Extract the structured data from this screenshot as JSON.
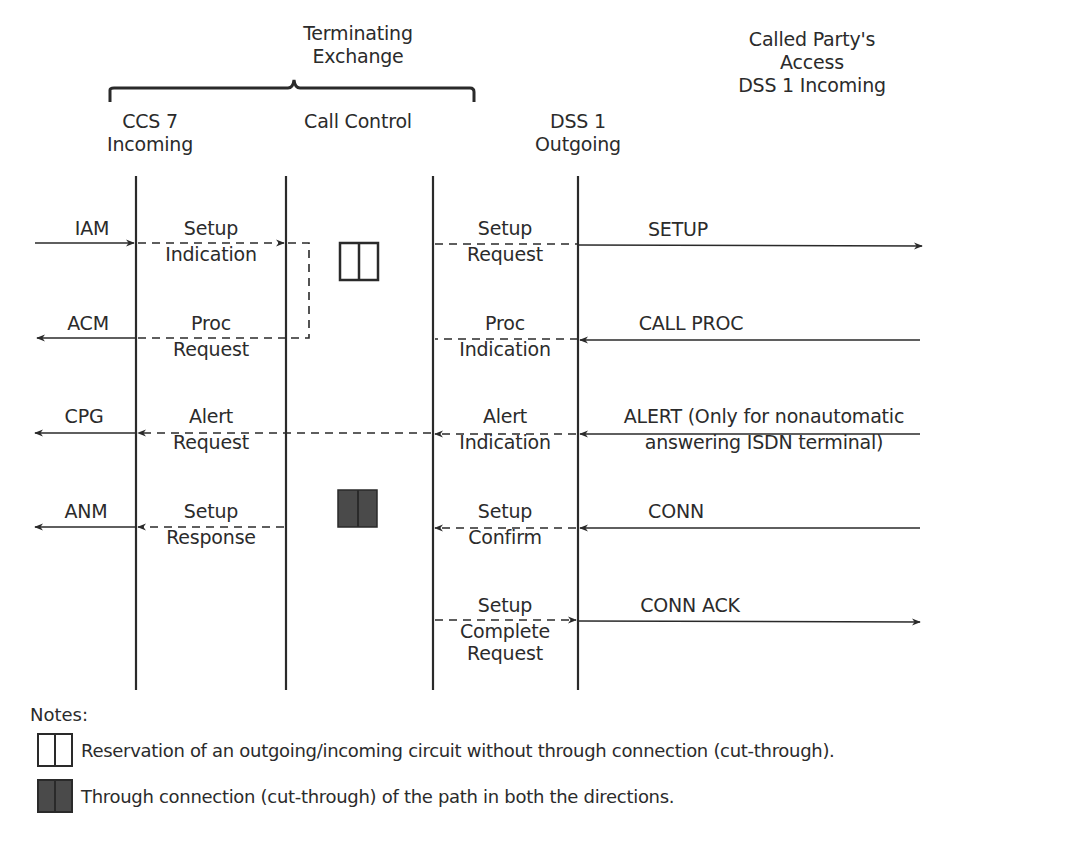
{
  "header": {
    "exchange_title": [
      "Terminating",
      "Exchange"
    ],
    "called_party": [
      "Called Party's",
      "Access",
      "DSS 1 Incoming"
    ],
    "columns": [
      {
        "id": "ccs7",
        "lines": [
          "CCS 7",
          "Incoming"
        ]
      },
      {
        "id": "call_control",
        "lines": [
          "Call Control"
        ]
      },
      {
        "id": "dss1_out",
        "lines": [
          "DSS 1",
          "Outgoing"
        ]
      }
    ]
  },
  "messages": {
    "left": [
      {
        "label": "IAM",
        "direction": "right"
      },
      {
        "label": "ACM",
        "direction": "left"
      },
      {
        "label": "CPG",
        "direction": "left"
      },
      {
        "label": "ANM",
        "direction": "left"
      }
    ],
    "ccs7_to_cc": [
      {
        "lines": [
          "Setup",
          "Indication"
        ],
        "direction": "right"
      },
      {
        "lines": [
          "Proc",
          "Request"
        ],
        "direction": "left"
      },
      {
        "lines": [
          "Alert",
          "Request"
        ],
        "direction": "left"
      },
      {
        "lines": [
          "Setup",
          "Response"
        ],
        "direction": "left"
      }
    ],
    "cc_to_dss1": [
      {
        "lines": [
          "Setup",
          "Request"
        ],
        "direction": "right"
      },
      {
        "lines": [
          "Proc",
          "Indication"
        ],
        "direction": "left"
      },
      {
        "lines": [
          "Alert",
          "Indication"
        ],
        "direction": "left"
      },
      {
        "lines": [
          "Setup",
          "Confirm"
        ],
        "direction": "left"
      },
      {
        "lines": [
          "Setup",
          "Complete",
          "Request"
        ],
        "direction": "right"
      }
    ],
    "right": [
      {
        "lines": [
          "SETUP"
        ],
        "direction": "right"
      },
      {
        "lines": [
          "CALL PROC"
        ],
        "direction": "left"
      },
      {
        "lines": [
          "ALERT (Only for nonautomatic",
          "answering ISDN terminal)"
        ],
        "direction": "left"
      },
      {
        "lines": [
          "CONN"
        ],
        "direction": "left"
      },
      {
        "lines": [
          "CONN ACK"
        ],
        "direction": "right"
      }
    ]
  },
  "notes": {
    "title": "Notes:",
    "items": [
      {
        "icon": "circuit-reserved-icon",
        "text": "Reservation of an outgoing/incoming circuit without through connection (cut-through)."
      },
      {
        "icon": "circuit-connected-icon",
        "text": "Through connection (cut-through) of the path in both the directions."
      }
    ]
  },
  "colors": {
    "line": "#2a2a2a",
    "text": "#2b2b2b",
    "filled_box": "#4a4a4a",
    "background": "#ffffff"
  }
}
